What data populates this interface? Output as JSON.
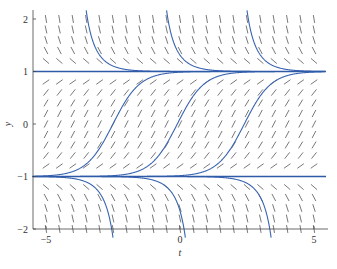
{
  "chart_data": {
    "type": "direction_field",
    "title": "",
    "equation": "dy/dt = 1 - y^2",
    "xlabel": "t",
    "ylabel": "y",
    "xlim": [
      -5.5,
      5.5
    ],
    "ylim": [
      -2.2,
      2.2
    ],
    "x_ticks": [
      -5,
      0,
      5
    ],
    "x_tick_labels": [
      "−5",
      "0",
      "5"
    ],
    "y_ticks": [
      -2,
      -1,
      0,
      1,
      2
    ],
    "y_tick_labels": [
      "−2",
      "−1",
      "0",
      "1",
      "2"
    ],
    "grid": false,
    "legend": null,
    "slope_field": {
      "t_start": -5,
      "t_end": 5,
      "t_step": 0.5,
      "y_values": [
        -2.0,
        -1.8,
        -1.6,
        -1.4,
        -1.2,
        -0.8,
        -0.6,
        -0.4,
        -0.2,
        0.0,
        0.2,
        0.4,
        0.6,
        0.8,
        1.2,
        1.4,
        1.6,
        1.8,
        2.0
      ]
    },
    "equilibria": [
      {
        "y": 1,
        "label": "stable equilibrium y = 1"
      },
      {
        "y": -1,
        "label": "unstable equilibrium y = -1"
      }
    ],
    "solution_curves": [
      {
        "kind": "tanh",
        "center_t": -2.5
      },
      {
        "kind": "tanh",
        "center_t": -0.1
      },
      {
        "kind": "tanh",
        "center_t": 2.4
      },
      {
        "kind": "coth_above",
        "pole_t": -4.0
      },
      {
        "kind": "coth_above",
        "pole_t": -1.0
      },
      {
        "kind": "coth_above",
        "pole_t": 2.0
      },
      {
        "kind": "coth_below",
        "pole_t": -2.0
      },
      {
        "kind": "coth_below",
        "pole_t": 0.7
      },
      {
        "kind": "coth_below",
        "pole_t": 3.9
      }
    ],
    "colors": {
      "curve": "#3a64b0",
      "equilibrium": "#2f5aa8",
      "slope_mark": "#555555",
      "axis": "#444444"
    }
  }
}
